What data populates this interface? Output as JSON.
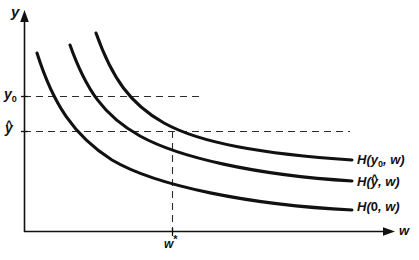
{
  "figure": {
    "type": "diagram",
    "kind": "economics-conditional-factor-demand-curves",
    "background_color": "#ffffff",
    "line_color": "#111111",
    "dash_color": "#2b2b2b",
    "axes": {
      "y_axis": {
        "label": "y",
        "label_icon": "y-axis-arrow-icon",
        "arrow": true,
        "x_px": 24,
        "top_px": 14,
        "bottom_px": 232
      },
      "x_axis": {
        "label": "w",
        "label_icon": "x-axis-arrow-icon",
        "arrow": true,
        "y_px": 232,
        "left_px": 24,
        "right_px": 392
      }
    },
    "y_ticks": [
      {
        "name": "y0",
        "label_plain": "y0",
        "label_base": "y",
        "label_sub": "0",
        "y_px": 96,
        "dash_end_px": 200
      },
      {
        "name": "yhat",
        "label_plain": "yhat",
        "label_base": "y",
        "label_hat": "^",
        "y_px": 131,
        "dash_end_px": 350
      }
    ],
    "x_ticks": [
      {
        "name": "wstar",
        "label_base": "w",
        "label_star": "*",
        "x_px": 172
      }
    ],
    "vertical_dropline": {
      "x_px": 172,
      "from_y_px": 131,
      "to_y_px": 232
    },
    "curves": [
      {
        "name": "H-y0-w",
        "label_base": "H(",
        "label_arg_base": "y",
        "label_arg_sub": "0",
        "label_tail": ", w)",
        "label_plain": "H(y0, w)",
        "start": [
          96,
          33
        ],
        "end": [
          352,
          160
        ]
      },
      {
        "name": "H-yhat-w",
        "label_base": "H(",
        "label_arg_base": "y",
        "label_arg_hat": "^",
        "label_tail": ", w)",
        "label_plain": "H(yhat, w)",
        "start": [
          70,
          45
        ],
        "end": [
          352,
          181
        ]
      },
      {
        "name": "H-0-w",
        "label_base": "H(",
        "label_arg_base": "0",
        "label_tail": ", w)",
        "label_plain": "H(0, w)",
        "start": [
          37,
          53
        ],
        "end": [
          352,
          210
        ]
      }
    ]
  }
}
